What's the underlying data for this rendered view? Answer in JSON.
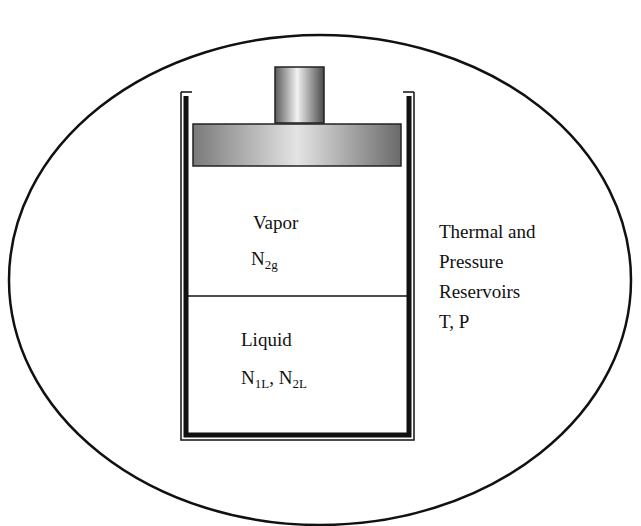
{
  "diagram": {
    "type": "piston-cylinder system in reservoir",
    "colors": {
      "stroke": "#111111",
      "piston_dark": "#6e6e6e",
      "piston_light": "#e8e8e8",
      "background": "#ffffff"
    },
    "vapor": {
      "label": "Vapor",
      "species": [
        {
          "base": "N",
          "sub": "2g"
        }
      ]
    },
    "liquid": {
      "label": "Liquid",
      "species": [
        {
          "base": "N",
          "sub": "1L"
        },
        {
          "base": "N",
          "sub": "2L"
        }
      ],
      "separator": ", "
    },
    "reservoir": {
      "lines": [
        "Thermal and",
        "Pressure",
        "Reservoirs",
        "T, P"
      ]
    }
  }
}
